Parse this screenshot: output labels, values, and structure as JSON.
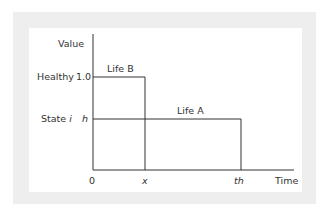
{
  "diagram": {
    "y_axis_label": "Value",
    "x_axis_label": "Time",
    "y_ticks": [
      {
        "category": "Healthy",
        "value": "1.0"
      },
      {
        "category": "State ",
        "category_italic": "i",
        "value": "h"
      }
    ],
    "x_ticks": [
      "0",
      "x",
      "th"
    ],
    "lines": [
      {
        "label": "Life B",
        "level": "1.0",
        "ends_at": "x"
      },
      {
        "label": "Life A",
        "level": "h",
        "ends_at": "th"
      }
    ],
    "colors": {
      "line": "#333333",
      "background_frame": "#eeeeee",
      "panel": "#ffffff"
    }
  }
}
